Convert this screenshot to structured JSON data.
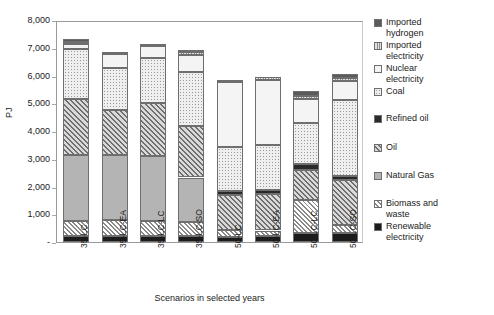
{
  "chart_data": {
    "type": "bar",
    "subtype": "stacked-column",
    "title": "",
    "xlabel": "Scenarios in selected years",
    "ylabel": "PJ",
    "ylim": [
      0,
      8000
    ],
    "yticks": [
      0,
      1000,
      2000,
      3000,
      4000,
      5000,
      6000,
      7000,
      8000
    ],
    "ytick_labels": [
      "-",
      "1,000",
      "2,000",
      "3,000",
      "4,000",
      "5,000",
      "6,000",
      "7,000",
      "8,000"
    ],
    "grid": false,
    "legend_position": "right",
    "categories": [
      "35-LC",
      "35-LC-EA",
      "35-LC-LC",
      "35-LC-SO",
      "50-LC",
      "50-LC-EA",
      "50-LC-LC",
      "50-LC-SO"
    ],
    "series": [
      {
        "name": "Renewable electricity",
        "fill": "f-renew",
        "values": [
          200,
          210,
          215,
          205,
          195,
          200,
          320,
          330
        ]
      },
      {
        "name": "Biomass and waste",
        "fill": "f-biomass",
        "values": [
          545,
          600,
          560,
          520,
          230,
          215,
          1190,
          290
        ]
      },
      {
        "name": "Natural Gas",
        "fill": "f-gas",
        "values": [
          2400,
          2340,
          2330,
          1600,
          0,
          0,
          0,
          0
        ]
      },
      {
        "name": "Oil",
        "fill": "f-oil",
        "values": [
          2005,
          1625,
          1890,
          1850,
          1255,
          1310,
          1090,
          1605
        ]
      },
      {
        "name": "Refined oil",
        "fill": "f-refined",
        "values": [
          0,
          0,
          0,
          0,
          160,
          150,
          225,
          160
        ]
      },
      {
        "name": "Coal",
        "fill": "f-coal",
        "values": [
          1790,
          1495,
          1640,
          1955,
          1570,
          1625,
          1470,
          2750
        ]
      },
      {
        "name": "Nuclear electricity",
        "fill": "f-nuclear",
        "values": [
          190,
          500,
          420,
          620,
          2340,
          2350,
          875,
          660
        ]
      },
      {
        "name": "Imported electricity",
        "fill": "f-impelec",
        "values": [
          95,
          90,
          95,
          80,
          95,
          95,
          100,
          120
        ]
      },
      {
        "name": "Imported hydrogen",
        "fill": "f-imphyd",
        "values": [
          75,
          0,
          0,
          60,
          0,
          0,
          155,
          145
        ]
      }
    ],
    "totals": [
      7300,
      6860,
      7150,
      6890,
      5845,
      5945,
      5425,
      6060
    ]
  },
  "legend": {
    "items": [
      {
        "label": "Imported\nhydrogen",
        "swatch": "f-imphyd",
        "top": 0
      },
      {
        "label": "Imported\nelectricity",
        "swatch": "f-impelec",
        "top": 23
      },
      {
        "label": "Nuclear\nelectricity",
        "swatch": "f-nuclear",
        "top": 46
      },
      {
        "label": "Coal",
        "swatch": "f-coal",
        "top": 69
      },
      {
        "label": "Refined oil",
        "swatch": "f-refined",
        "top": 96
      },
      {
        "label": "Oil",
        "swatch": "f-oil",
        "top": 125
      },
      {
        "label": "Natural Gas",
        "swatch": "f-gas",
        "top": 153
      },
      {
        "label": "Biomass and\nwaste",
        "swatch": "f-biomass",
        "top": 181
      },
      {
        "label": "Renewable\nelectricity",
        "swatch": "f-renew",
        "top": 204
      }
    ]
  },
  "colors": {
    "axis_line": "#9a9a9a",
    "segment_border": "#6e6e6e",
    "text": "#1a1a1a",
    "background": "#ffffff"
  }
}
